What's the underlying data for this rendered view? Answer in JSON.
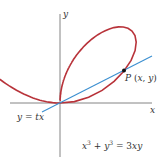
{
  "diagram": {
    "axes": {
      "x_label": "x",
      "y_label": "y"
    },
    "curve_label": "x³ + y³ = 3xy",
    "line_label": "y = tx",
    "point_label": "P (x, y)",
    "colors": {
      "curve": "#b8333a",
      "line": "#3b8fd0",
      "axes": "#666666",
      "point": "#111111"
    }
  }
}
